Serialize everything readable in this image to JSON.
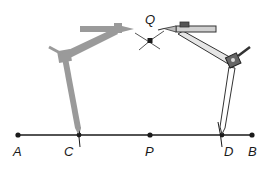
{
  "diagram": {
    "type": "geometric-construction",
    "colors": {
      "line": "#1a1a1a",
      "ghost_compass": "#9a9a9a",
      "compass_outline": "#333333",
      "compass_fill": "#d9d9d9"
    },
    "points": {
      "A": {
        "label": "A",
        "x": 18,
        "y": 135
      },
      "C": {
        "label": "C",
        "x": 79,
        "y": 135
      },
      "P": {
        "label": "P",
        "x": 150,
        "y": 135
      },
      "D": {
        "label": "D",
        "x": 222,
        "y": 135
      },
      "B": {
        "label": "B",
        "x": 252,
        "y": 135
      },
      "Q": {
        "label": "Q",
        "x": 150,
        "y": 40
      }
    }
  }
}
